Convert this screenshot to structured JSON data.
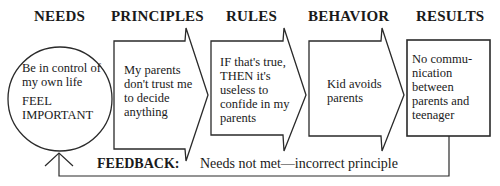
{
  "diagram": {
    "headings": {
      "needs": "NEEDS",
      "principles": "PRINCIPLES",
      "rules": "RULES",
      "behavior": "BEHAVIOR",
      "results": "RESULTS"
    },
    "needs": {
      "line1": "Be in control of",
      "line2": "my own life",
      "line3": "FEEL",
      "line4": "IMPORTANT"
    },
    "principles": {
      "line1": "My parents",
      "line2": "don't trust me",
      "line3": "to decide",
      "line4": "anything"
    },
    "rules": {
      "line1": "IF that's true,",
      "line2": "THEN it's",
      "line3": "useless to",
      "line4": "confide in my",
      "line5": "parents"
    },
    "behavior": {
      "line1": "Kid avoids",
      "line2": "parents"
    },
    "results": {
      "line1": "No commu-",
      "line2": "nication",
      "line3": "between",
      "line4": "parents and",
      "line5": "teenager"
    },
    "feedback": {
      "label": "FEEDBACK:",
      "text": "Needs not met—incorrect principle"
    },
    "colors": {
      "stroke": "#2a2a2a",
      "background": "#ffffff"
    }
  }
}
